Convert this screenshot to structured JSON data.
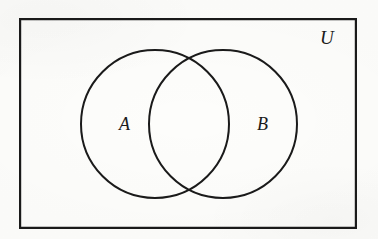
{
  "figure": {
    "type": "venn-diagram",
    "background_color": "#fdfdfb",
    "stroke_color": "#1a1a1a"
  },
  "universe": {
    "label": "U",
    "shape": "rectangle",
    "x": 19,
    "y": 18,
    "width": 338,
    "height": 211,
    "stroke_width": 2.2
  },
  "sets": [
    {
      "label": "A",
      "shape": "circle",
      "cx": 155,
      "cy": 124,
      "r": 74,
      "stroke_width": 2.0,
      "label_x": 119,
      "label_y": 115
    },
    {
      "label": "B",
      "shape": "circle",
      "cx": 223,
      "cy": 124,
      "r": 74,
      "stroke_width": 2.0,
      "label_x": 257,
      "label_y": 115
    }
  ],
  "intersections": [
    {
      "name": "upper-crossing",
      "x": 189,
      "y": 60
    },
    {
      "name": "lower-crossing",
      "x": 189,
      "y": 188
    }
  ]
}
